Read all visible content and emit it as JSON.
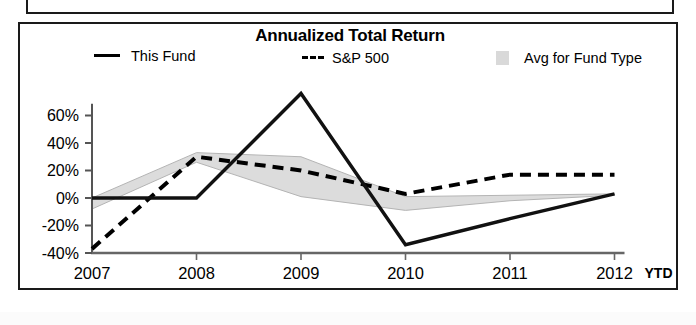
{
  "chart_data": {
    "type": "line",
    "title": "Annualized Total Return",
    "xlabel": "",
    "ylabel": "",
    "x": [
      "2007",
      "2008",
      "2009",
      "2010",
      "2011",
      "2012"
    ],
    "x_axis_suffix": "YTD",
    "xtick_labels": [
      "2007",
      "2008",
      "2009",
      "2010",
      "2011",
      "2012"
    ],
    "ytick_labels": [
      "60%",
      "40%",
      "20%",
      "0%",
      "-20%",
      "-40%"
    ],
    "ytick_values": [
      60,
      40,
      20,
      0,
      -20,
      -40
    ],
    "ylim": [
      -40,
      70
    ],
    "grid": false,
    "legend_position": "top",
    "series": [
      {
        "name": "This Fund",
        "style": "solid",
        "color": "#000000",
        "values": [
          0,
          0,
          76,
          -34,
          -15,
          3
        ]
      },
      {
        "name": "S&P 500",
        "style": "dashed",
        "color": "#000000",
        "values": [
          -37,
          30,
          20,
          3,
          17,
          17
        ]
      },
      {
        "name": "Avg for Fund Type",
        "style": "band",
        "color": "#d9d9d9",
        "band_upper": [
          0,
          33,
          30,
          1,
          2,
          3
        ],
        "band_lower": [
          -8,
          26,
          1,
          -9,
          -2,
          2
        ]
      }
    ]
  },
  "panel": {
    "title": "Annualized Total Return"
  },
  "legend": {
    "items": [
      {
        "label": "This Fund",
        "marker": "solid-line-swatch"
      },
      {
        "label": "S&P 500",
        "marker": "dashed-line-swatch"
      },
      {
        "label": "Avg for Fund Type",
        "marker": "gray-box-swatch"
      }
    ]
  },
  "axes": {
    "y_labels": [
      "60%",
      "40%",
      "20%",
      "0%",
      "-20%",
      "-40%"
    ],
    "x_labels": [
      "2007",
      "2008",
      "2009",
      "2010",
      "2011",
      "2012"
    ],
    "x_suffix": "YTD"
  }
}
